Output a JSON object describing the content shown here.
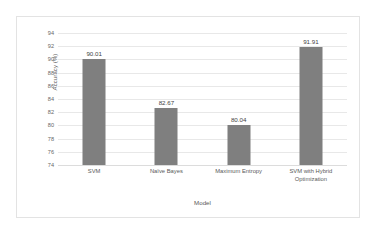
{
  "chart_data": {
    "type": "bar",
    "title": "",
    "xlabel": "Model",
    "ylabel": "Accuracy (%)",
    "categories": [
      "SVM",
      "Naïve Bayes",
      "Maximum Entropy",
      "SVM with Hybrid Optimization"
    ],
    "category_lines": [
      [
        "SVM"
      ],
      [
        "Naïve Bayes"
      ],
      [
        "Maximum Entropy"
      ],
      [
        "SVM with Hybrid",
        "Optimization"
      ]
    ],
    "values": [
      90.01,
      82.67,
      80.04,
      91.91
    ],
    "value_labels": [
      "90.01",
      "82.67",
      "80.04",
      "91.91"
    ],
    "ylim": [
      74,
      94
    ],
    "ytick_step": 2,
    "ytick_labels": [
      "94",
      "92",
      "90",
      "88",
      "86",
      "84",
      "82",
      "80",
      "78",
      "76",
      "74"
    ],
    "grid": true,
    "legend": false,
    "bar_color": "#7f7f7f",
    "gridline_color": "#e8e8e8",
    "plot_background": "#ffffff",
    "border_color": "#e3e3e3"
  }
}
